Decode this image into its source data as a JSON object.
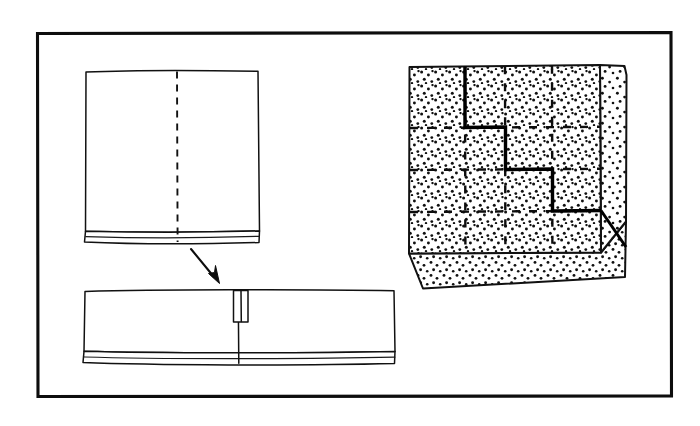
{
  "figure": {
    "title": "Folded sheet and stippled block with stepped cut",
    "border": {
      "x": 36,
      "y": 32,
      "width": 636,
      "height": 365,
      "color": "#0d0d0d",
      "stroke_width": 3.1
    },
    "background_color": "#ffffff",
    "ink_color": "#111111"
  },
  "panels": {
    "unfolded_sheet": {
      "label": "unfolded-sheet",
      "x": 84,
      "y": 70,
      "width": 176,
      "height": 172,
      "fold_line": {
        "label": "center-fold-dashed-line",
        "x": 177,
        "y1": 71,
        "y2": 243,
        "style": "dashed"
      },
      "bottom_edge_strip": {
        "label": "sheet-thickness-strip",
        "y_top": 231,
        "y_bottom": 243
      }
    },
    "transform_arrow": {
      "label": "fold-direction-arrow",
      "from_x": 192,
      "from_y": 249,
      "to_x": 219,
      "to_y": 281,
      "direction": "down-right"
    },
    "folded_sheet": {
      "label": "folded-sheet",
      "x": 83,
      "y": 289,
      "width": 312,
      "height": 75,
      "seam_line": {
        "label": "center-seam-line",
        "x": 238,
        "y1": 290,
        "y2": 363
      },
      "tab": {
        "label": "fold-tab-notch",
        "x": 234,
        "y": 290,
        "width": 14,
        "height": 32
      },
      "bottom_edge_strip": {
        "label": "sheet-thickness-strip",
        "y_top": 350,
        "y_bottom": 364
      }
    },
    "stippled_block": {
      "label": "stippled-block",
      "front_face": {
        "label": "block-front-face",
        "points": "409,67 600,65 601,253 409,254"
      },
      "right_face": {
        "label": "block-right-face",
        "points": "600,65 625,66 626,74 626,222 601,253"
      },
      "bottom_face": {
        "label": "block-bottom-face",
        "points": "409,254 601,253 626,222 626,278 421,289 409,254"
      },
      "fill_pattern": "stipple-dots",
      "grid": {
        "label": "dashed-grid",
        "vertical_lines_x": [
          465,
          505,
          552
        ],
        "horizontal_lines_y": [
          128,
          170,
          212
        ],
        "style": "dashed",
        "rows": 4,
        "columns": 4
      },
      "cut_path": {
        "label": "stepped-cut-path",
        "front_points": "465,66 465,128 505,128 505,170 552,170 552,212 601,212",
        "side_points": "601,212 626,248",
        "style": "solid-bold-staircase"
      }
    }
  }
}
